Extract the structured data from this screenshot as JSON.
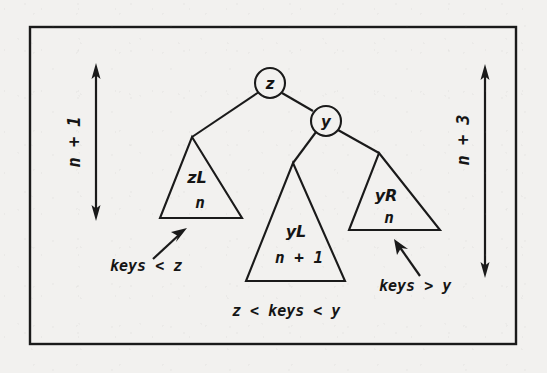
{
  "figure": {
    "background_color": "#f2f1ef",
    "ink_color": "#1a1a1a",
    "border": {
      "name": "figure-frame",
      "x": 30,
      "y": 27,
      "width": 486,
      "height": 317
    }
  },
  "nodes": [
    {
      "id": "z",
      "label": "z",
      "cx": 270,
      "cy": 83,
      "r": 15
    },
    {
      "id": "y",
      "label": "y",
      "cx": 326,
      "cy": 121,
      "r": 15
    }
  ],
  "edges": [
    {
      "from": "z",
      "to": "zL-apex",
      "x1": 258,
      "y1": 93,
      "x2": 192,
      "y2": 137
    },
    {
      "from": "z",
      "to": "y",
      "x1": 282,
      "y1": 93,
      "x2": 314,
      "y2": 112
    },
    {
      "from": "y",
      "to": "yL-apex",
      "x1": 316,
      "y1": 131,
      "x2": 293,
      "y2": 163
    },
    {
      "from": "y",
      "to": "yR-apex",
      "x1": 337,
      "y1": 130,
      "x2": 379,
      "y2": 153
    }
  ],
  "subtrees": [
    {
      "id": "zL",
      "name": "subtree-zL",
      "label": "zL",
      "height_label": "n",
      "apex_x": 192,
      "apex_y": 137,
      "base_left_x": 160,
      "base_right_x": 242,
      "base_y": 218,
      "label_x": 197,
      "label_y": 182,
      "height_x": 200,
      "height_y": 207
    },
    {
      "id": "yL",
      "name": "subtree-yL",
      "label": "yL",
      "height_label": "n + 1",
      "apex_x": 293,
      "apex_y": 163,
      "base_left_x": 246,
      "base_right_x": 345,
      "base_y": 281,
      "label_x": 296,
      "label_y": 236,
      "height_x": 299,
      "height_y": 262
    },
    {
      "id": "yR",
      "name": "subtree-yR",
      "label": "yR",
      "height_label": "n",
      "apex_x": 379,
      "apex_y": 153,
      "base_left_x": 349,
      "base_right_x": 440,
      "base_y": 230,
      "label_x": 385,
      "label_y": 200,
      "height_x": 389,
      "height_y": 222
    }
  ],
  "height_arrows": [
    {
      "id": "left-height-arrow",
      "name": "height-arrow-left",
      "label": "n + 1",
      "x": 96,
      "y_top": 65,
      "y_bottom": 218,
      "label_x": 80,
      "label_y": 142
    },
    {
      "id": "right-height-arrow",
      "name": "height-arrow-right",
      "label": "n + 3",
      "x": 485,
      "y_top": 66,
      "y_bottom": 275,
      "label_x": 469,
      "label_y": 140
    }
  ],
  "annotations": [
    {
      "id": "keys-lt-z",
      "name": "annotation-keys-less-than-z",
      "text": "keys < z",
      "text_x": 110,
      "text_y": 270,
      "anchor": "start",
      "arrow": {
        "x1": 153,
        "y1": 259,
        "x2": 186,
        "y2": 229
      }
    },
    {
      "id": "keys-gt-y",
      "name": "annotation-keys-greater-than-y",
      "text": "keys > y",
      "text_x": 379,
      "text_y": 290,
      "anchor": "start",
      "arrow": {
        "x1": 420,
        "y1": 276,
        "x2": 394,
        "y2": 240
      }
    },
    {
      "id": "z-lt-keys-lt-y",
      "name": "annotation-z-less-keys-less-y",
      "text": "z < keys < y",
      "text_x": 232,
      "text_y": 315,
      "anchor": "start",
      "arrow": null
    }
  ]
}
